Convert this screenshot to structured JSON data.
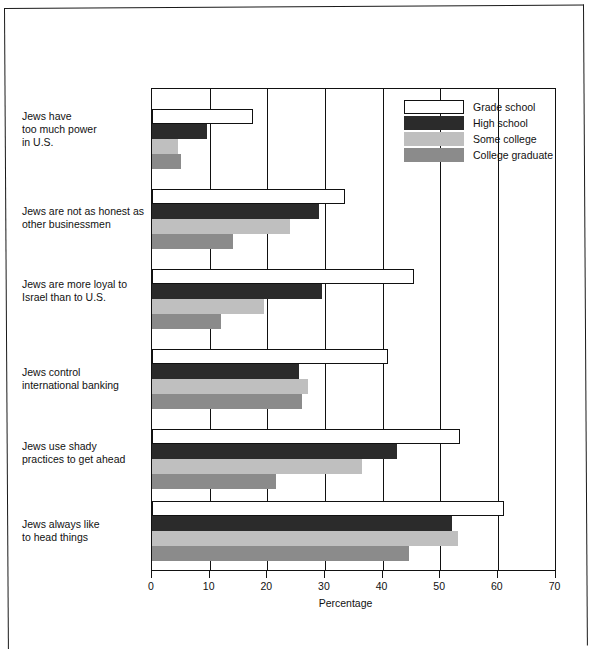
{
  "chart_data": {
    "type": "bar",
    "orientation": "horizontal",
    "title": "",
    "xlabel": "Percentage",
    "ylabel": "",
    "xlim": [
      0,
      70
    ],
    "xticks": [
      0,
      10,
      20,
      30,
      40,
      50,
      60,
      70
    ],
    "grid": true,
    "grid_axis": "x",
    "legend_position": "top-right",
    "categories": [
      "Jews have too much power in U.S.",
      "Jews are not as honest as other businessmen",
      "Jews are more loyal to Israel than to U.S.",
      "Jews control international banking",
      "Jews use shady practices to get ahead",
      "Jews always like to head things"
    ],
    "category_lines": [
      [
        "Jews have",
        "too much power",
        "in U.S."
      ],
      [
        "Jews are not as honest as",
        "other businessmen"
      ],
      [
        "Jews are more loyal to",
        "Israel than to U.S."
      ],
      [
        "Jews control",
        "international banking"
      ],
      [
        "Jews use shady",
        "practices to get ahead"
      ],
      [
        "Jews always like",
        "to head things"
      ]
    ],
    "series": [
      {
        "name": "Grade school",
        "color": "#ffffff",
        "border": "#111111",
        "values": [
          17.5,
          33.5,
          45.5,
          41.0,
          53.5,
          61.0
        ]
      },
      {
        "name": "High school",
        "color": "#2b2b2b",
        "border": "#2b2b2b",
        "values": [
          9.5,
          29.0,
          29.5,
          25.5,
          42.5,
          52.0
        ]
      },
      {
        "name": "Some college",
        "color": "#bfbfbf",
        "border": "#bfbfbf",
        "values": [
          4.5,
          24.0,
          19.5,
          27.0,
          36.5,
          53.0
        ]
      },
      {
        "name": "College graduate",
        "color": "#8b8b8b",
        "border": "#8b8b8b",
        "values": [
          5.0,
          14.0,
          12.0,
          26.0,
          21.5,
          44.5
        ]
      }
    ]
  },
  "legend": {
    "items": [
      {
        "label": "Grade school"
      },
      {
        "label": "High school"
      },
      {
        "label": "Some college"
      },
      {
        "label": "College graduate"
      }
    ]
  },
  "axis": {
    "xlabel": "Percentage",
    "ticks": [
      "0",
      "10",
      "20",
      "30",
      "40",
      "50",
      "60",
      "70"
    ]
  },
  "caption": ""
}
